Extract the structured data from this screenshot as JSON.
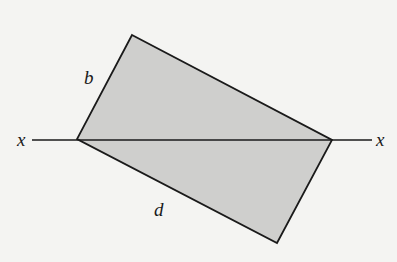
{
  "diagram": {
    "type": "rectangle bisected by axis",
    "labels": {
      "axis_left": "x",
      "axis_right": "x",
      "side_short": "b",
      "side_long": "d"
    },
    "colors": {
      "background": "#f4f4f2",
      "fill": "#cfcfcd",
      "stroke": "#1a1a1a"
    },
    "geometry": {
      "vertices": [
        [
          132,
          35
        ],
        [
          332,
          140
        ],
        [
          277,
          243
        ],
        [
          77,
          139
        ]
      ],
      "axis": {
        "x1": 32,
        "y1": 140,
        "x2": 372,
        "y2": 140
      }
    }
  }
}
